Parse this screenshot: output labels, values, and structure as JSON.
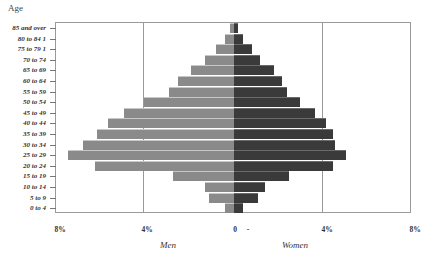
{
  "chart_data": {
    "type": "bar",
    "subtype": "population-pyramid",
    "title": "",
    "ylabel": "Age",
    "xlabel_left": "Men",
    "xlabel_right": "Women",
    "categories": [
      "85 and over",
      "80 to 84 1",
      "75 to 79 1",
      "70 to 74",
      "65 to 69",
      "60 to 64",
      "55 to 59",
      "50 to 54",
      "45 to 49",
      "40 to 44",
      "35 to 39",
      "30 to 34",
      "25 to 29",
      "20 to 24",
      "15 to 19",
      "10 to 14",
      "5 to 9",
      "0 to 4"
    ],
    "series": [
      {
        "name": "Men",
        "color": "#8a8a8a",
        "values": [
          0.2,
          0.4,
          0.8,
          1.3,
          1.9,
          2.5,
          2.9,
          4.0,
          4.9,
          5.6,
          6.1,
          6.7,
          7.4,
          6.2,
          2.7,
          1.3,
          1.1,
          0.4
        ]
      },
      {
        "name": "Women",
        "color": "#3a3a3a",
        "values": [
          0.2,
          0.4,
          0.8,
          1.2,
          1.8,
          2.2,
          2.4,
          3.0,
          3.7,
          4.2,
          4.5,
          4.6,
          5.1,
          4.5,
          2.5,
          1.4,
          1.1,
          0.4
        ]
      }
    ],
    "x_tick_labels": [
      "8%",
      "4%",
      "0",
      "-",
      "4%",
      "8%"
    ],
    "xlim": [
      -8,
      8
    ],
    "grid": "vertical lines at 4%",
    "legend": "none (group labels below axis)"
  },
  "labels": {
    "age": "Age",
    "men": "Men",
    "women": "Women",
    "ticks": {
      "l8": "8%",
      "l4": "4%",
      "zero": "0",
      "dash": "-",
      "r4": "4%",
      "r8": "8%"
    }
  }
}
